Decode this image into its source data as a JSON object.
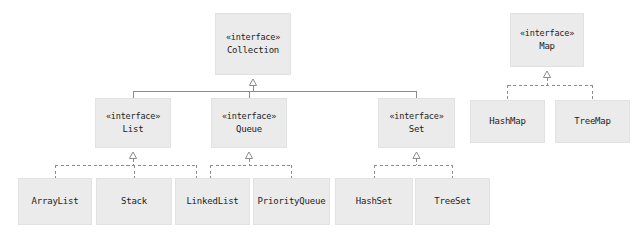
{
  "diagram": {
    "type": "uml-class-diagram",
    "background_color": "#ffffff",
    "box_fill_color": "#ebebeb",
    "box_border_color": "#e2e2e2",
    "line_color": "#8c8c8c",
    "text_color": "#1d1d1d",
    "stereotype_label": "«interface»"
  },
  "nodes": {
    "collection": {
      "stereotype": "«interface»",
      "name": "Collection",
      "x": 215,
      "y": 13,
      "w": 76,
      "h": 62,
      "kind": "interface"
    },
    "map": {
      "stereotype": "«interface»",
      "name": "Map",
      "x": 510,
      "y": 13,
      "w": 74,
      "h": 54,
      "kind": "interface"
    },
    "list": {
      "stereotype": "«interface»",
      "name": "List",
      "x": 95,
      "y": 98,
      "w": 76,
      "h": 50,
      "kind": "interface"
    },
    "queue": {
      "stereotype": "«interface»",
      "name": "Queue",
      "x": 211,
      "y": 98,
      "w": 76,
      "h": 50,
      "kind": "interface"
    },
    "set": {
      "stereotype": "«interface»",
      "name": "Set",
      "x": 378,
      "y": 98,
      "w": 77,
      "h": 50,
      "kind": "interface"
    },
    "hashmap": {
      "stereotype": "",
      "name": "HashMap",
      "x": 470,
      "y": 100,
      "w": 75,
      "h": 43,
      "kind": "class"
    },
    "treemap": {
      "stereotype": "",
      "name": "TreeMap",
      "x": 555,
      "y": 100,
      "w": 75,
      "h": 43,
      "kind": "class"
    },
    "arraylist": {
      "stereotype": "",
      "name": "ArrayList",
      "x": 18,
      "y": 178,
      "w": 74,
      "h": 47,
      "kind": "class"
    },
    "stack": {
      "stereotype": "",
      "name": "Stack",
      "x": 96,
      "y": 178,
      "w": 76,
      "h": 47,
      "kind": "class"
    },
    "linkedlist": {
      "stereotype": "",
      "name": "LinkedList",
      "x": 175,
      "y": 178,
      "w": 75,
      "h": 47,
      "kind": "class"
    },
    "priorityqueue": {
      "stereotype": "",
      "name": "PriorityQueue",
      "x": 253,
      "y": 178,
      "w": 77,
      "h": 47,
      "kind": "class"
    },
    "hashset": {
      "stereotype": "",
      "name": "HashSet",
      "x": 335,
      "y": 178,
      "w": 78,
      "h": 47,
      "kind": "class"
    },
    "treeset": {
      "stereotype": "",
      "name": "TreeSet",
      "x": 415,
      "y": 178,
      "w": 75,
      "h": 47,
      "kind": "class"
    }
  },
  "edges": [
    {
      "from": "collection",
      "to": "list",
      "style": "generalization",
      "line": "solid"
    },
    {
      "from": "collection",
      "to": "queue",
      "style": "generalization",
      "line": "solid"
    },
    {
      "from": "collection",
      "to": "set",
      "style": "generalization",
      "line": "solid"
    },
    {
      "from": "list",
      "to": "arraylist",
      "style": "realization",
      "line": "dashed"
    },
    {
      "from": "list",
      "to": "stack",
      "style": "realization",
      "line": "dashed"
    },
    {
      "from": "list",
      "to": "linkedlist",
      "style": "realization",
      "line": "dashed"
    },
    {
      "from": "queue",
      "to": "linkedlist",
      "style": "realization",
      "line": "dashed"
    },
    {
      "from": "queue",
      "to": "priorityqueue",
      "style": "realization",
      "line": "dashed"
    },
    {
      "from": "set",
      "to": "hashset",
      "style": "realization",
      "line": "dashed"
    },
    {
      "from": "set",
      "to": "treeset",
      "style": "realization",
      "line": "dashed"
    },
    {
      "from": "map",
      "to": "hashmap",
      "style": "realization",
      "line": "dashed"
    },
    {
      "from": "map",
      "to": "treemap",
      "style": "realization",
      "line": "dashed"
    }
  ]
}
